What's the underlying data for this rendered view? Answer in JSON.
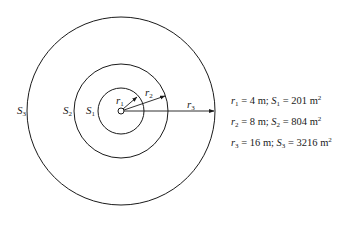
{
  "diagram": {
    "type": "concentric-circles",
    "center": {
      "x": 121,
      "y": 111
    },
    "circles": [
      {
        "id": "S1",
        "label": "S",
        "label_sub": "1",
        "radius_px": 23
      },
      {
        "id": "S2",
        "label": "S",
        "label_sub": "2",
        "radius_px": 47
      },
      {
        "id": "S3",
        "label": "S",
        "label_sub": "3",
        "radius_px": 94
      }
    ],
    "radii_labels": [
      {
        "label": "r",
        "sub": "1"
      },
      {
        "label": "r",
        "sub": "2"
      },
      {
        "label": "r",
        "sub": "3"
      }
    ]
  },
  "legend": [
    {
      "r": "r",
      "r_sub": "1",
      "eq1": " =  4 m; ",
      "s": "S",
      "s_sub": "1",
      "eq2": " =  201 m",
      "sup": "2"
    },
    {
      "r": "r",
      "r_sub": "2",
      "eq1": " =  8 m; ",
      "s": "S",
      "s_sub": "2",
      "eq2": " =  804 m",
      "sup": "2"
    },
    {
      "r": "r",
      "r_sub": "3",
      "eq1": " = 16 m; ",
      "s": "S",
      "s_sub": "3",
      "eq2": " = 3216 m",
      "sup": "2"
    }
  ]
}
